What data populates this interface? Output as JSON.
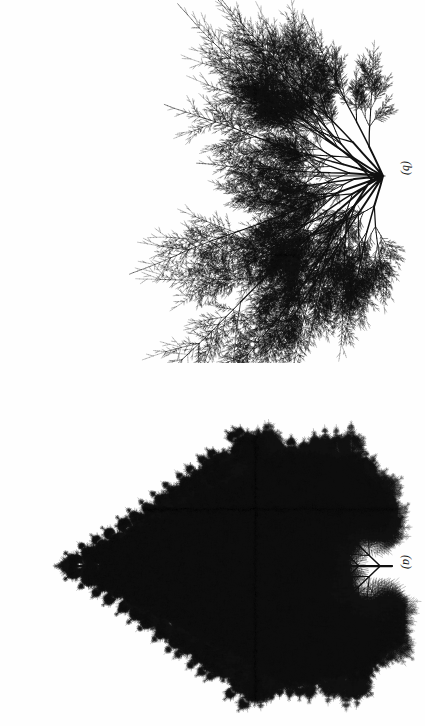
{
  "figure": {
    "background_color": "#fefefe",
    "ink_color": "#111111",
    "width": 425,
    "height": 726,
    "orientation_note": "rotated-90"
  },
  "panels": [
    {
      "id": "b",
      "label": "(b)",
      "label_style": "italic-parenthesized",
      "kind": "asymmetric-random-branching-fractal",
      "description": "sparse irregular dendritic branching cluster",
      "origin": {
        "x": 385,
        "y": 176
      },
      "main_axis_angle_deg": 180,
      "trunk_length": 66,
      "depth": 10,
      "branch_angle_deg": 26,
      "sub_angle_deg": 48,
      "scale_main": 0.86,
      "scale_side": 0.56,
      "jitter": 0.46,
      "base_width": 1.9,
      "seed": 917363,
      "fan_angles_deg": [
        -74,
        -58,
        -44,
        -31,
        -19,
        -8,
        4,
        17,
        31,
        48,
        66
      ],
      "fan_lengths": [
        104,
        150,
        132,
        118,
        163,
        96,
        112,
        138,
        120,
        150,
        108
      ]
    },
    {
      "id": "a",
      "label": "(a)",
      "label_style": "italic-parenthesized",
      "kind": "symmetric-fern-fractal",
      "description": "bilaterally symmetric pinnate fern frond, apex at left",
      "apex": {
        "x": 70,
        "y": 203
      },
      "base": {
        "x": 392,
        "y": 203
      },
      "rachis_length": 322,
      "pinna_count": 15,
      "pinna_angle_deg": 44,
      "pinnule_angle_deg": 42,
      "depth": 6,
      "scale_child": 0.7,
      "max_pinna_length": 150,
      "base_width": 1.5,
      "seed": 20414,
      "mirror": true
    }
  ],
  "labels": {
    "panel_b": "(b)",
    "panel_a": "(a)"
  }
}
